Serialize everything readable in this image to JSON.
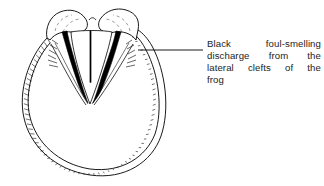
{
  "figure": {
    "name": "hoof-thrush-diagram",
    "background_color": "#ffffff",
    "line_color": "#000000",
    "discharge_color": "#000000"
  },
  "annotation": {
    "full_text": "Black foul-smelling discharge from the lateral clefts of the frog",
    "lines": [
      "Black   foul-smelling",
      "discharge  from  the",
      "lateral  clefts  of  the",
      "frog"
    ],
    "leader_line": {
      "from_x": 138,
      "from_y": 50,
      "to_x": 203,
      "to_y": 50
    }
  },
  "structures": [
    {
      "name": "hoof-wall",
      "label": "Hoof wall"
    },
    {
      "name": "bulb-of-heel-left",
      "label": "Bulb of heel (left)"
    },
    {
      "name": "bulb-of-heel-right",
      "label": "Bulb of heel (right)"
    },
    {
      "name": "frog",
      "label": "Frog"
    },
    {
      "name": "central-sulcus",
      "label": "Central sulcus of frog"
    },
    {
      "name": "lateral-cleft-left",
      "label": "Left lateral cleft"
    },
    {
      "name": "lateral-cleft-right",
      "label": "Right lateral cleft"
    },
    {
      "name": "bar-left",
      "label": "Left bar"
    },
    {
      "name": "bar-right",
      "label": "Right bar"
    }
  ]
}
